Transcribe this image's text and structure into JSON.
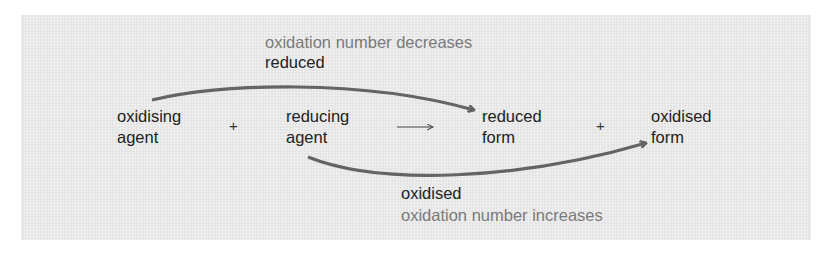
{
  "diagram": {
    "colors": {
      "background": "#e4e4e4",
      "text": "#222222",
      "muted_text": "#7a7a7a",
      "arrow": "#646464"
    },
    "top_annotation": {
      "caption": "oxidation number decreases",
      "label": "reduced"
    },
    "bottom_annotation": {
      "label": "oxidised",
      "caption": "oxidation number increases"
    },
    "equation": {
      "reactant1": {
        "line1": "oxidising",
        "line2": "agent"
      },
      "plus1": "+",
      "reactant2": {
        "line1": "reducing",
        "line2": "agent"
      },
      "yields": "→",
      "product1": {
        "line1": "reduced",
        "line2": "form"
      },
      "plus2": "+",
      "product2": {
        "line1": "oxidised",
        "line2": "form"
      }
    },
    "arrows": [
      {
        "from": "oxidising agent",
        "to": "reduced form",
        "meaning": "reduced"
      },
      {
        "from": "reducing agent",
        "to": "oxidised form",
        "meaning": "oxidised"
      }
    ]
  }
}
